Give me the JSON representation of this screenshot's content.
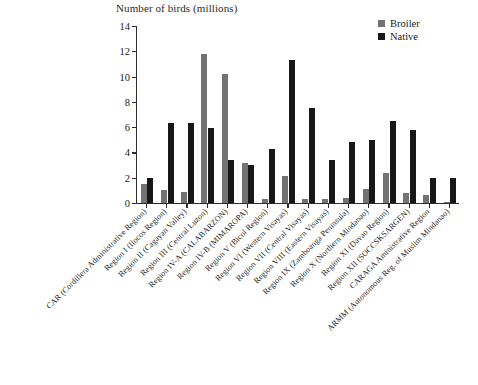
{
  "chart_data": {
    "type": "bar",
    "title": "Number of birds (millions)",
    "xlabel": "",
    "ylabel": "Number of birds (millions)",
    "ylim": [
      0,
      14
    ],
    "ytick_step": 2,
    "yticks": [
      0,
      2,
      4,
      6,
      8,
      10,
      12,
      14
    ],
    "grid": false,
    "legend_position": "top-right",
    "categories": [
      "CAR (Cordillera Administrative Region)",
      "Region I (Ilocos Region)",
      "Region II (Cagayan Valley)",
      "Region III (Central Luzon)",
      "Region IV-A (CALABARZON)",
      "Region IV-B (MIMAROPA)",
      "Region V (Bicol Region)",
      "Region VI (Western Visayas)",
      "Region VII (Central Visayas)",
      "Region VIII (Eastern Visayas)",
      "Region IX (Zamboanga Peninsula)",
      "Region X (Northern Mindanao)",
      "Region XI (Davao Region)",
      "Region XII (SOCCSKSARGEN)",
      "CARAGA Aministrative Region",
      "ARMM (Autonomous Reg. of Muslim Mindanao)"
    ],
    "series": [
      {
        "name": "Broiler",
        "color": "#737373",
        "values": [
          1.5,
          1.0,
          0.9,
          11.8,
          10.2,
          3.2,
          0.3,
          2.1,
          0.3,
          0.3,
          0.4,
          1.1,
          2.4,
          0.8,
          0.6,
          0.05
        ]
      },
      {
        "name": "Native",
        "color": "#171717",
        "values": [
          2.0,
          6.3,
          6.3,
          5.9,
          3.4,
          3.0,
          4.3,
          11.3,
          7.5,
          3.4,
          4.8,
          5.0,
          6.5,
          5.8,
          2.0,
          2.0
        ]
      }
    ]
  },
  "legend": {
    "items": [
      {
        "label": "Broiler",
        "color": "#737373"
      },
      {
        "label": "Native",
        "color": "#171717"
      }
    ]
  }
}
